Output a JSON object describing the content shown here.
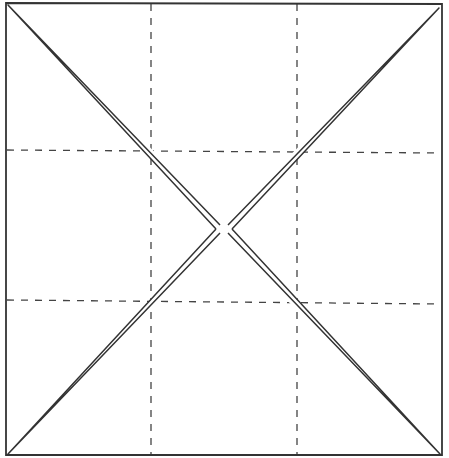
{
  "diagram": {
    "canvas": {
      "width": 449,
      "height": 458
    },
    "square": {
      "left": 6,
      "top": 3,
      "right": 442,
      "bottom": 455
    },
    "grid": {
      "vertical_x": [
        151,
        297
      ],
      "horizontal_y_left": [
        150,
        300
      ],
      "horizontal_y_right": [
        153,
        304
      ],
      "style": "dashed"
    },
    "center": {
      "x": 224,
      "y": 229
    },
    "colors": {
      "stroke": "#333333",
      "dash": "#444444",
      "background": "#ffffff"
    },
    "labels": []
  }
}
